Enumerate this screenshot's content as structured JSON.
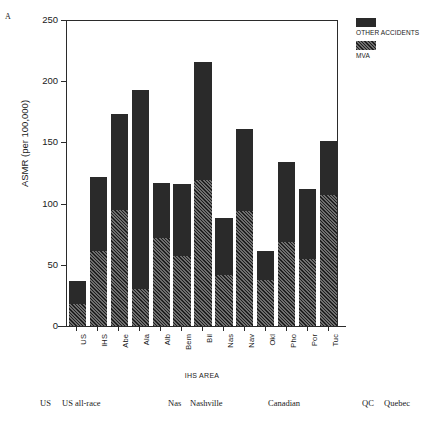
{
  "figure": {
    "panel_letter": "A"
  },
  "legend": {
    "position": "top-right",
    "entries": [
      {
        "label": "OTHER ACCIDENTS",
        "swatch": "solid-dark",
        "color": "#2a2a2a"
      },
      {
        "label": "MVA",
        "swatch": "hatched",
        "color": "#6e6e6e"
      }
    ]
  },
  "key_table": {
    "columns": [
      {
        "rows": [
          {
            "abbr": "US",
            "full": "US all-race"
          }
        ]
      },
      {
        "rows": [
          {
            "abbr": "Nas",
            "full": "Nashville"
          }
        ]
      },
      {
        "rows": [
          {
            "abbr": "",
            "full": "Canadian"
          }
        ]
      },
      {
        "rows": [
          {
            "abbr": "QC",
            "full": "Quebec"
          }
        ]
      }
    ]
  },
  "chart_data": {
    "type": "bar",
    "subtype": "stacked",
    "title": "",
    "xlabel": "IHS AREA",
    "ylabel": "ASMR (per 100,000)",
    "ylim": [
      0,
      250
    ],
    "yticks": [
      0,
      50,
      100,
      150,
      200,
      250
    ],
    "ytick_labels": [
      "0",
      "50",
      "100",
      "150",
      "200",
      "250"
    ],
    "grid": false,
    "categories": [
      "US",
      "IHS",
      "Abe",
      "Ala",
      "Alb",
      "Bem",
      "Bil",
      "Nas",
      "Nav",
      "Okl",
      "Pho",
      "Por",
      "Tuc"
    ],
    "series": [
      {
        "name": "MVA",
        "color": "#6e6e6e",
        "pattern": "hatched",
        "values": [
          18,
          61,
          95,
          30,
          72,
          57,
          119,
          42,
          94,
          38,
          69,
          55,
          107
        ]
      },
      {
        "name": "OTHER ACCIDENTS",
        "color": "#2a2a2a",
        "pattern": "solid",
        "values": [
          19,
          61,
          78,
          163,
          45,
          59,
          97,
          46,
          67,
          23,
          65,
          57,
          44
        ]
      }
    ],
    "totals": [
      37,
      122,
      173,
      193,
      117,
      116,
      216,
      88,
      161,
      61,
      134,
      112,
      151
    ]
  }
}
